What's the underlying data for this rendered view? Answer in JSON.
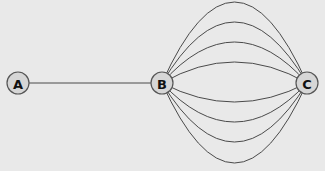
{
  "diagram": {
    "type": "multigraph",
    "nodes": [
      {
        "id": "A",
        "label": "A",
        "x": 18,
        "y": 83
      },
      {
        "id": "B",
        "label": "B",
        "x": 162,
        "y": 83
      },
      {
        "id": "C",
        "label": "C",
        "x": 307,
        "y": 83
      }
    ],
    "edges": [
      {
        "from": "A",
        "to": "B",
        "apex_y": 83
      },
      {
        "from": "B",
        "to": "C",
        "apex_y": 2
      },
      {
        "from": "B",
        "to": "C",
        "apex_y": 22
      },
      {
        "from": "B",
        "to": "C",
        "apex_y": 42
      },
      {
        "from": "B",
        "to": "C",
        "apex_y": 62
      },
      {
        "from": "B",
        "to": "C",
        "apex_y": 102
      },
      {
        "from": "B",
        "to": "C",
        "apex_y": 122
      },
      {
        "from": "B",
        "to": "C",
        "apex_y": 142
      },
      {
        "from": "B",
        "to": "C",
        "apex_y": 163
      }
    ],
    "colors": {
      "background": "#e9e9e9",
      "node_fill": "#d6d6d6",
      "stroke": "#4a4a4a"
    }
  }
}
